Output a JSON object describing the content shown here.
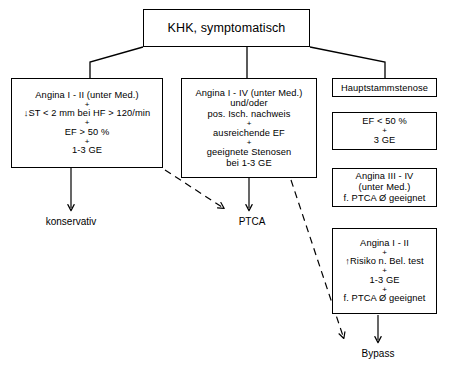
{
  "diagram": {
    "title": "KHK, symptomatisch",
    "language": "de",
    "root": {
      "id": "root",
      "text": "KHK, symptomatisch"
    },
    "nodes": {
      "left": {
        "id": "angina-1-2-med",
        "lines": [
          "Angina I - II (unter Med.)",
          "+",
          "↓ST < 2 mm bei HF > 120/min",
          "+",
          "EF > 50 %",
          "+",
          "1-3 GE"
        ]
      },
      "middle": {
        "id": "angina-1-4-med",
        "lines": [
          "Angina I - IV (unter Med.)",
          "und/oder",
          "pos. Isch. nachweis",
          "+",
          "ausreichende EF",
          "+",
          "geeignete Stenosen",
          "bei 1-3 GE"
        ]
      },
      "hauptstamm": {
        "id": "hauptstammstenose",
        "lines": [
          "Hauptstammstenose"
        ]
      },
      "ef_low": {
        "id": "ef-under-50",
        "lines": [
          "EF < 50 %",
          "+",
          "3 GE"
        ]
      },
      "angina_3_4": {
        "id": "angina-3-4-no-ptca",
        "lines": [
          "Angina III - IV",
          "(unter Med.)",
          "f. PTCA Ø geeignet"
        ]
      },
      "angina_1_2_risk": {
        "id": "angina-1-2-high-risk",
        "lines": [
          "Angina I - II",
          "+",
          "↑Risiko n. Bel. test",
          "+",
          "1-3 GE",
          "+",
          "f. PTCA Ø geeignet"
        ]
      }
    },
    "outcomes": {
      "konservativ": "konservativ",
      "ptca": "PTCA",
      "bypass": "Bypass"
    },
    "edges": [
      {
        "from": "root",
        "to": "left",
        "style": "solid"
      },
      {
        "from": "root",
        "to": "middle",
        "style": "solid"
      },
      {
        "from": "root",
        "to": "hauptstamm",
        "style": "solid"
      },
      {
        "from": "left",
        "to": "konservativ",
        "style": "solid-arrow"
      },
      {
        "from": "left",
        "to": "ptca",
        "style": "dashed-arrow"
      },
      {
        "from": "middle",
        "to": "ptca",
        "style": "solid-arrow"
      },
      {
        "from": "middle",
        "to": "bypass",
        "style": "dashed-arrow"
      },
      {
        "from": "angina_1_2_risk",
        "to": "bypass",
        "style": "solid-arrow"
      }
    ],
    "colors": {
      "stroke": "#000000",
      "background": "#ffffff",
      "text": "#000000"
    }
  }
}
